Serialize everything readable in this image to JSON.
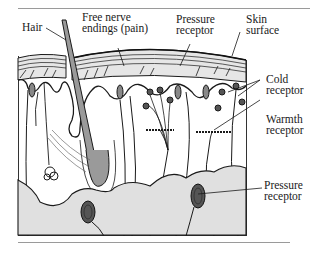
{
  "figure": {
    "labels": {
      "hair": "Hair",
      "free_nerve": [
        "Free nerve",
        "endings (pain)"
      ],
      "pressure_top": [
        "Pressure",
        "receptor"
      ],
      "skin_surface": [
        "Skin",
        "surface"
      ],
      "cold": [
        "Cold",
        "receptor"
      ],
      "warmth": [
        "Warmth",
        "receptor"
      ],
      "pressure_bottom": [
        "Pressure",
        "receptor"
      ]
    },
    "colors": {
      "ink": "#1a1a1a",
      "tissue_fill": "#dcdcdc",
      "hair_fill": "#9a9a9a",
      "background": "#ffffff"
    }
  }
}
